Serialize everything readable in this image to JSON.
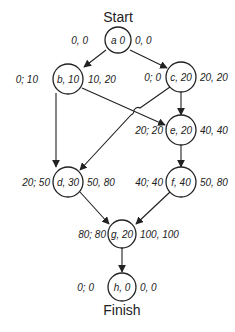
{
  "diagram": {
    "start_label": "Start",
    "finish_label": "Finish",
    "nodes": {
      "a": {
        "text": "a 0",
        "left": "0, 0",
        "right": "0, 0"
      },
      "b": {
        "text": "b, 10",
        "left": "0; 10",
        "right": "10, 20"
      },
      "c": {
        "text": "c, 20",
        "left": "0; 0",
        "right": "20, 20"
      },
      "d": {
        "text": "d, 30",
        "left": "20; 50",
        "right": "50, 80"
      },
      "e": {
        "text": "e, 20",
        "left": "20; 20",
        "right": "40, 40"
      },
      "f": {
        "text": "f, 40",
        "left": "40; 40",
        "right": "50, 80"
      },
      "g": {
        "text": "g, 20",
        "left": "80; 80",
        "right": "100, 100"
      },
      "h": {
        "text": "h, 0",
        "left": "0; 0",
        "right": "0, 0"
      }
    },
    "edges": [
      [
        "a",
        "b"
      ],
      [
        "a",
        "c"
      ],
      [
        "b",
        "d"
      ],
      [
        "b",
        "e"
      ],
      [
        "c",
        "e"
      ],
      [
        "c",
        "d"
      ],
      [
        "e",
        "f"
      ],
      [
        "d",
        "g"
      ],
      [
        "f",
        "g"
      ],
      [
        "g",
        "h"
      ]
    ]
  }
}
